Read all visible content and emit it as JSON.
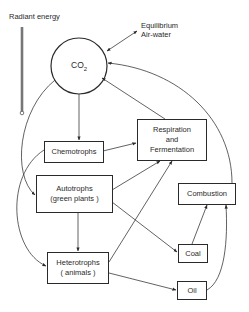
{
  "diagram": {
    "radiant_energy": "Radiant energy",
    "equilibrium": {
      "line1": "Equilibrium",
      "line2": "Air-water"
    },
    "co2": {
      "base": "CO",
      "sub": "2"
    },
    "nodes": {
      "chemotrophs": {
        "line1": "Chemotrophs"
      },
      "autotrophs": {
        "line1": "Autotrophs",
        "line2": "(green plants )"
      },
      "heterotrophs": {
        "line1": "Heterotrophs",
        "line2": "( animals )"
      },
      "respiration": {
        "line1": "Respiration",
        "line2": "and",
        "line3": "Fermentation"
      },
      "combustion": {
        "line1": "Combustion"
      },
      "coal": {
        "line1": "Coal"
      },
      "oil": {
        "line1": "Oil"
      }
    },
    "edges": [
      {
        "from": "CO2",
        "to": "Chemotrophs"
      },
      {
        "from": "CO2",
        "to": "Autotrophs"
      },
      {
        "from": "Chemotrophs",
        "to": "Heterotrophs"
      },
      {
        "from": "Chemotrophs",
        "to": "Respiration and Fermentation"
      },
      {
        "from": "Autotrophs",
        "to": "Heterotrophs"
      },
      {
        "from": "Autotrophs",
        "to": "Respiration and Fermentation"
      },
      {
        "from": "Autotrophs",
        "to": "Coal"
      },
      {
        "from": "Heterotrophs",
        "to": "Respiration and Fermentation"
      },
      {
        "from": "Heterotrophs",
        "to": "Oil"
      },
      {
        "from": "Respiration and Fermentation",
        "to": "CO2"
      },
      {
        "from": "Combustion",
        "to": "CO2"
      },
      {
        "from": "Coal",
        "to": "Combustion"
      },
      {
        "from": "Oil",
        "to": "Combustion"
      },
      {
        "from": "CO2",
        "to": "Equilibrium Air-water",
        "bidirectional": true
      }
    ]
  }
}
